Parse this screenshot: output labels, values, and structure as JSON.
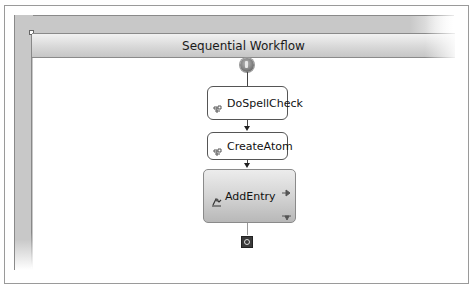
{
  "designer": {
    "header": {
      "title": "Sequential Workflow"
    },
    "activities": [
      {
        "name": "DoSpellCheck",
        "icon": "code-activity-icon"
      },
      {
        "name": "CreateAtom",
        "icon": "code-activity-icon"
      },
      {
        "name": "AddEntry",
        "icon": "composite-activity-icon"
      }
    ],
    "start_icon": "workflow-start-icon",
    "end_icon": "workflow-end-icon"
  }
}
